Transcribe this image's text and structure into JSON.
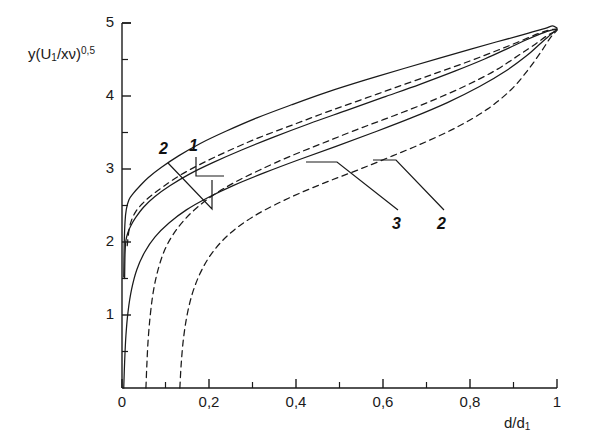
{
  "figure": {
    "background": "#ffffff",
    "ink_color": "#1a1a1a"
  },
  "axes": {
    "y_label_prefix": "y(U",
    "y_label_sub": "1",
    "y_label_mid": "/xν)",
    "y_label_sup": "0,5",
    "x_label_prefix": "d/d",
    "x_label_sub": "1"
  },
  "chart_data": {
    "type": "line",
    "title": "",
    "xlabel": "d/d1",
    "ylabel": "y(U1/xv)^0,5",
    "xlim": [
      0,
      1
    ],
    "ylim": [
      0,
      5
    ],
    "grid": false,
    "legend_position": "inline-leaders",
    "x_ticks": [
      0,
      0.2,
      0.4,
      0.6,
      0.8,
      1
    ],
    "x_tick_labels": [
      "0",
      "0,2",
      "0,4",
      "0,6",
      "0,8",
      "1"
    ],
    "x_minor_ticks": [
      0.1,
      0.3,
      0.5,
      0.7,
      0.9
    ],
    "y_ticks": [
      1,
      2,
      3,
      4,
      5
    ],
    "y_tick_labels": [
      "1",
      "2",
      "3",
      "4",
      "5"
    ],
    "y_minor_ticks": [
      0.5,
      1.5,
      2.5,
      3.5,
      4.5
    ],
    "series": [
      {
        "name": "1-solid-upper",
        "style": "solid",
        "points": [
          [
            0.004,
            1.52
          ],
          [
            0.005,
            1.95
          ],
          [
            0.007,
            2.28
          ],
          [
            0.01,
            2.45
          ],
          [
            0.016,
            2.58
          ],
          [
            0.025,
            2.66
          ],
          [
            0.04,
            2.76
          ],
          [
            0.06,
            2.88
          ],
          [
            0.09,
            3.02
          ],
          [
            0.13,
            3.18
          ],
          [
            0.18,
            3.35
          ],
          [
            0.24,
            3.52
          ],
          [
            0.31,
            3.7
          ],
          [
            0.39,
            3.88
          ],
          [
            0.47,
            4.05
          ],
          [
            0.56,
            4.22
          ],
          [
            0.65,
            4.38
          ],
          [
            0.73,
            4.52
          ],
          [
            0.8,
            4.64
          ],
          [
            0.86,
            4.74
          ],
          [
            0.91,
            4.82
          ],
          [
            0.95,
            4.89
          ],
          [
            0.975,
            4.93
          ],
          [
            0.99,
            4.96
          ],
          [
            1.0,
            4.93
          ]
        ]
      },
      {
        "name": "2-dashed-upper",
        "style": "dashed",
        "points": [
          [
            0.012,
            1.95
          ],
          [
            0.016,
            2.16
          ],
          [
            0.022,
            2.3
          ],
          [
            0.032,
            2.42
          ],
          [
            0.046,
            2.52
          ],
          [
            0.066,
            2.63
          ],
          [
            0.095,
            2.76
          ],
          [
            0.135,
            2.92
          ],
          [
            0.185,
            3.08
          ],
          [
            0.245,
            3.25
          ],
          [
            0.315,
            3.43
          ],
          [
            0.395,
            3.61
          ],
          [
            0.475,
            3.79
          ],
          [
            0.56,
            3.97
          ],
          [
            0.645,
            4.15
          ],
          [
            0.725,
            4.32
          ],
          [
            0.8,
            4.48
          ],
          [
            0.865,
            4.63
          ],
          [
            0.915,
            4.75
          ],
          [
            0.955,
            4.85
          ],
          [
            0.98,
            4.9
          ],
          [
            1.0,
            4.92
          ]
        ]
      },
      {
        "name": "1-solid-middle",
        "style": "solid",
        "points": [
          [
            0.006,
            1.5
          ],
          [
            0.007,
            1.85
          ],
          [
            0.009,
            2.02
          ],
          [
            0.013,
            2.12
          ],
          [
            0.02,
            2.22
          ],
          [
            0.032,
            2.34
          ],
          [
            0.05,
            2.48
          ],
          [
            0.075,
            2.62
          ],
          [
            0.11,
            2.77
          ],
          [
            0.155,
            2.93
          ],
          [
            0.21,
            3.09
          ],
          [
            0.275,
            3.26
          ],
          [
            0.35,
            3.44
          ],
          [
            0.43,
            3.62
          ],
          [
            0.515,
            3.8
          ],
          [
            0.6,
            3.98
          ],
          [
            0.685,
            4.16
          ],
          [
            0.765,
            4.34
          ],
          [
            0.835,
            4.51
          ],
          [
            0.89,
            4.66
          ],
          [
            0.93,
            4.77
          ],
          [
            0.962,
            4.85
          ],
          [
            0.985,
            4.9
          ],
          [
            1.0,
            4.91
          ]
        ]
      },
      {
        "name": "3-dashed-middle",
        "style": "dashed",
        "points": [
          [
            0.055,
            0.0
          ],
          [
            0.057,
            0.3
          ],
          [
            0.06,
            0.65
          ],
          [
            0.065,
            1.0
          ],
          [
            0.072,
            1.32
          ],
          [
            0.082,
            1.6
          ],
          [
            0.096,
            1.86
          ],
          [
            0.115,
            2.08
          ],
          [
            0.14,
            2.28
          ],
          [
            0.172,
            2.47
          ],
          [
            0.212,
            2.65
          ],
          [
            0.26,
            2.82
          ],
          [
            0.318,
            2.99
          ],
          [
            0.385,
            3.17
          ],
          [
            0.46,
            3.35
          ],
          [
            0.54,
            3.54
          ],
          [
            0.625,
            3.73
          ],
          [
            0.71,
            3.93
          ],
          [
            0.79,
            4.14
          ],
          [
            0.858,
            4.35
          ],
          [
            0.91,
            4.55
          ],
          [
            0.95,
            4.71
          ],
          [
            0.978,
            4.83
          ],
          [
            1.0,
            4.9
          ]
        ]
      },
      {
        "name": "3-solid-lower",
        "style": "solid",
        "points": [
          [
            0.004,
            0.0
          ],
          [
            0.006,
            0.35
          ],
          [
            0.009,
            0.72
          ],
          [
            0.014,
            1.05
          ],
          [
            0.022,
            1.35
          ],
          [
            0.034,
            1.62
          ],
          [
            0.052,
            1.86
          ],
          [
            0.076,
            2.07
          ],
          [
            0.108,
            2.26
          ],
          [
            0.148,
            2.44
          ],
          [
            0.198,
            2.61
          ],
          [
            0.258,
            2.78
          ],
          [
            0.328,
            2.95
          ],
          [
            0.408,
            3.13
          ],
          [
            0.492,
            3.31
          ],
          [
            0.578,
            3.5
          ],
          [
            0.665,
            3.7
          ],
          [
            0.748,
            3.91
          ],
          [
            0.822,
            4.13
          ],
          [
            0.884,
            4.35
          ],
          [
            0.93,
            4.55
          ],
          [
            0.962,
            4.72
          ],
          [
            0.985,
            4.84
          ],
          [
            1.0,
            4.91
          ]
        ]
      },
      {
        "name": "2-dashed-lower",
        "style": "dashed",
        "points": [
          [
            0.133,
            0.0
          ],
          [
            0.136,
            0.32
          ],
          [
            0.141,
            0.66
          ],
          [
            0.149,
            0.98
          ],
          [
            0.161,
            1.28
          ],
          [
            0.178,
            1.55
          ],
          [
            0.2,
            1.79
          ],
          [
            0.228,
            2.0
          ],
          [
            0.263,
            2.19
          ],
          [
            0.305,
            2.36
          ],
          [
            0.355,
            2.52
          ],
          [
            0.413,
            2.68
          ],
          [
            0.478,
            2.84
          ],
          [
            0.548,
            3.0
          ],
          [
            0.622,
            3.18
          ],
          [
            0.698,
            3.37
          ],
          [
            0.772,
            3.58
          ],
          [
            0.84,
            3.82
          ],
          [
            0.895,
            4.09
          ],
          [
            0.935,
            4.37
          ],
          [
            0.965,
            4.62
          ],
          [
            0.985,
            4.8
          ],
          [
            1.0,
            4.9
          ]
        ]
      }
    ],
    "annotations": [
      {
        "label": "2",
        "x_px": 159,
        "y_px": 140
      },
      {
        "label": "1",
        "x_px": 189,
        "y_px": 137
      },
      {
        "label": "3",
        "x_px": 392,
        "y_px": 215
      },
      {
        "label": "2",
        "x_px": 437,
        "y_px": 215
      }
    ]
  }
}
